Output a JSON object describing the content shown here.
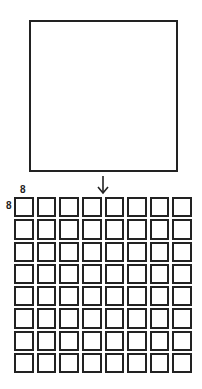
{
  "diagram": {
    "input": {
      "shape": "square",
      "label": ""
    },
    "arrow": {
      "direction": "down"
    },
    "grid": {
      "rows": 8,
      "cols": 8,
      "row_label": "8",
      "col_label": "8"
    }
  },
  "colors": {
    "stroke": "#222222",
    "fill": "#ffffff"
  }
}
